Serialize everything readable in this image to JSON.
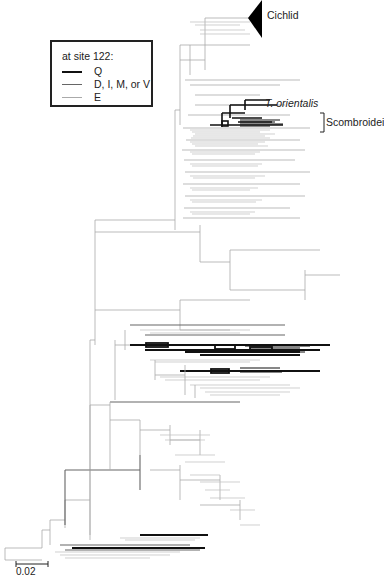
{
  "legend": {
    "title": "at site  122:",
    "items": [
      {
        "label": "Q",
        "color": "#111111",
        "width": 2.2
      },
      {
        "label": "D, I, M, or V",
        "color": "#666666",
        "width": 1.6
      },
      {
        "label": "E",
        "color": "#aaaaaa",
        "width": 1.2
      }
    ]
  },
  "labels": {
    "cichlid": "Cichlid",
    "t_orientalis": "T. orientalis",
    "scombroidei": "Scombroidei"
  },
  "scale_bar": {
    "label": "0.02"
  },
  "colors": {
    "q": "#111111",
    "dimv": "#666666",
    "e": "#aaaaaa"
  }
}
